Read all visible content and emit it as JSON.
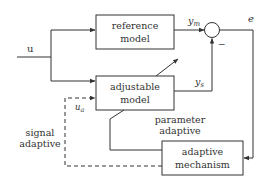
{
  "diagram": {
    "blocks": {
      "reference_model": {
        "line1": "reference",
        "line2": "model"
      },
      "adjustable_model": {
        "line1": "adjustable",
        "line2": "model"
      },
      "adaptive_mechanism": {
        "line1": "adaptive",
        "line2": "mechanism"
      }
    },
    "signals": {
      "input": "u",
      "reference_output": "y",
      "reference_output_sub": "m",
      "adjustable_output": "y",
      "adjustable_output_sub": "s",
      "error": "e",
      "adaptive_signal": "u",
      "adaptive_signal_sub": "a",
      "minus_sign": "−"
    },
    "annotations": {
      "parameter_adaptive_line1": "parameter",
      "parameter_adaptive_line2": "adaptive",
      "signal_adaptive_line1": "signal",
      "signal_adaptive_line2": "adaptive"
    },
    "colors": {
      "stroke": "#333333",
      "background": "#ffffff"
    }
  }
}
